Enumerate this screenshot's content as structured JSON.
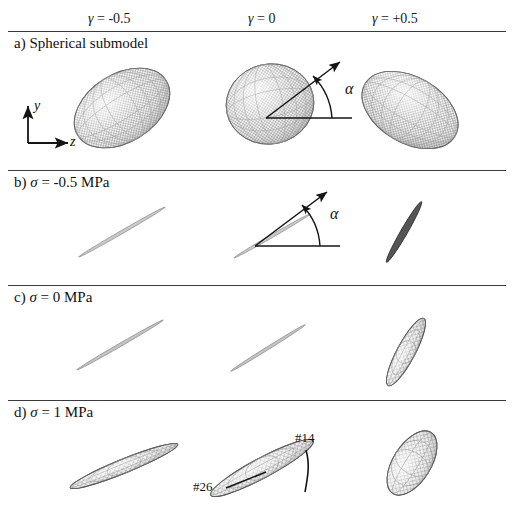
{
  "figure": {
    "caption_columns_note": "columns vary gamma, rows vary sigma"
  },
  "columns": [
    {
      "label": "γ = -0.5",
      "value": -0.5,
      "x_center": 122
    },
    {
      "label": "γ = 0",
      "value": 0,
      "x_center": 270
    },
    {
      "label": "γ = +0.5",
      "value": 0.5,
      "x_center": 404
    }
  ],
  "rows": [
    {
      "key": "a",
      "label": "a) Spherical submodel",
      "sigma": null,
      "rule_y": 31,
      "label_y": 36
    },
    {
      "key": "b",
      "label": "b) σ = -0.5 MPa",
      "sigma": -0.5,
      "rule_y": 170,
      "label_y": 175
    },
    {
      "key": "c",
      "label": "c) σ = 0 MPa",
      "sigma": 0,
      "rule_y": 285,
      "label_y": 290
    },
    {
      "key": "d",
      "label": "d) σ = 1 MPa",
      "sigma": 1,
      "rule_y": 400,
      "label_y": 405
    }
  ],
  "axes_indicator": {
    "name": "coordinate-axes",
    "y_label": "y",
    "z_label": "z",
    "origin_x": 28,
    "origin_y": 143
  },
  "angle_annotations": [
    {
      "name": "alpha-row-a",
      "label": "α",
      "x": 345,
      "y": 80
    },
    {
      "name": "alpha-row-b",
      "label": "α",
      "x": 330,
      "y": 213
    }
  ],
  "tip_annotations": [
    {
      "name": "tag-26",
      "label": "#26",
      "x": 196,
      "y": 487
    },
    {
      "name": "tag-14",
      "label": "#14",
      "x": 297,
      "y": 437
    }
  ],
  "ellipsoids": [
    {
      "row": "a",
      "col": 0,
      "name": "ellipsoid-a-gamma-neg05",
      "cx": 122,
      "cy": 108,
      "rx": 52,
      "ry": 34,
      "rot": -32,
      "fill": "#e8e8e8",
      "mesh": true,
      "dark": false
    },
    {
      "row": "a",
      "col": 1,
      "name": "ellipsoid-a-gamma-0",
      "cx": 270,
      "cy": 104,
      "rx": 44,
      "ry": 40,
      "rot": -12,
      "fill": "#e6e6e6",
      "mesh": true,
      "dark": false
    },
    {
      "row": "a",
      "col": 2,
      "name": "ellipsoid-a-gamma-pos05",
      "cx": 410,
      "cy": 110,
      "rx": 52,
      "ry": 33,
      "rot": 30,
      "fill": "#ebebeb",
      "mesh": true,
      "dark": false
    },
    {
      "row": "b",
      "col": 0,
      "name": "ellipsoid-b-gamma-neg05",
      "cx": 122,
      "cy": 232,
      "rx": 50,
      "ry": 2,
      "rot": -30,
      "fill": "#bdbdbd",
      "mesh": false,
      "dark": false
    },
    {
      "row": "b",
      "col": 1,
      "name": "ellipsoid-b-gamma-0",
      "cx": 272,
      "cy": 236,
      "rx": 44,
      "ry": 2,
      "rot": -30,
      "fill": "#bdbdbd",
      "mesh": false,
      "dark": false
    },
    {
      "row": "b",
      "col": 2,
      "name": "ellipsoid-b-gamma-pos05",
      "cx": 404,
      "cy": 232,
      "rx": 35,
      "ry": 4,
      "rot": -60,
      "fill": "#4a4a4a",
      "mesh": false,
      "dark": true
    },
    {
      "row": "c",
      "col": 0,
      "name": "ellipsoid-c-gamma-neg05",
      "cx": 120,
      "cy": 345,
      "rx": 50,
      "ry": 2,
      "rot": -30,
      "fill": "#b5b5b5",
      "mesh": false,
      "dark": false
    },
    {
      "row": "c",
      "col": 1,
      "name": "ellipsoid-c-gamma-0",
      "cx": 268,
      "cy": 348,
      "rx": 44,
      "ry": 2,
      "rot": -32,
      "fill": "#b5b5b5",
      "mesh": false,
      "dark": false
    },
    {
      "row": "c",
      "col": 2,
      "name": "ellipsoid-c-gamma-pos05",
      "cx": 406,
      "cy": 352,
      "rx": 38,
      "ry": 9,
      "rot": -62,
      "fill": "#d8d8d8",
      "mesh": true,
      "dark": false
    },
    {
      "row": "d",
      "col": 0,
      "name": "ellipsoid-d-gamma-neg05",
      "cx": 124,
      "cy": 466,
      "rx": 58,
      "ry": 7,
      "rot": -22,
      "fill": "#d5d5d5",
      "mesh": true,
      "dark": false
    },
    {
      "row": "d",
      "col": 1,
      "name": "ellipsoid-d-gamma-0",
      "cx": 262,
      "cy": 468,
      "rx": 58,
      "ry": 10,
      "rot": -28,
      "fill": "#d5d5d5",
      "mesh": true,
      "dark": false
    },
    {
      "row": "d",
      "col": 2,
      "name": "ellipsoid-d-gamma-pos05",
      "cx": 412,
      "cy": 463,
      "rx": 36,
      "ry": 19,
      "rot": -58,
      "fill": "#dcdcdc",
      "mesh": true,
      "dark": false
    }
  ],
  "colors": {
    "rule": "#3a3a3a",
    "ink": "#111111",
    "mesh_line": "#8a8a8a",
    "outline": "#6f6f6f"
  }
}
